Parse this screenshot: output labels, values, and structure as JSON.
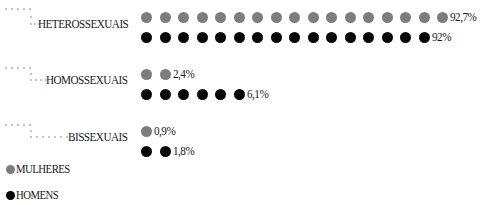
{
  "colors": {
    "mulheres": "#7d7d7d",
    "homens": "#050505",
    "connector": "#b8b8b8"
  },
  "legend": [
    {
      "key": "mulheres",
      "label": "MULHERES",
      "color": "#7d7d7d"
    },
    {
      "key": "homens",
      "label": "HOMENS",
      "color": "#050505"
    }
  ],
  "categories": [
    {
      "label": "HETEROSSEXUAIS",
      "mulheres": {
        "dots": 17,
        "value": "92,7%"
      },
      "homens": {
        "dots": 16,
        "value": "92%"
      }
    },
    {
      "label": "HOMOSSEXUAIS",
      "mulheres": {
        "dots": 2,
        "value": "2,4%"
      },
      "homens": {
        "dots": 6,
        "value": "6,1%"
      }
    },
    {
      "label": "BISSEXUAIS",
      "mulheres": {
        "dots": 1,
        "value": "0,9%"
      },
      "homens": {
        "dots": 2,
        "value": "1,8%"
      }
    }
  ],
  "chart_data": {
    "type": "bar",
    "style": "dot-pictogram",
    "title": "",
    "categories": [
      "HETEROSSEXUAIS",
      "HOMOSSEXUAIS",
      "BISSEXUAIS"
    ],
    "series": [
      {
        "name": "MULHERES",
        "color": "#7d7d7d",
        "values": [
          92.7,
          2.4,
          0.9
        ],
        "labels": [
          "92,7%",
          "2,4%",
          "0,9%"
        ],
        "dot_counts": [
          17,
          2,
          1
        ]
      },
      {
        "name": "HOMENS",
        "color": "#050505",
        "values": [
          92.0,
          6.1,
          1.8
        ],
        "labels": [
          "92%",
          "6,1%",
          "1,8%"
        ],
        "dot_counts": [
          16,
          6,
          2
        ]
      }
    ],
    "xlabel": "",
    "ylabel": "",
    "legend_position": "bottom-left",
    "grid": false,
    "orientation": "horizontal"
  }
}
